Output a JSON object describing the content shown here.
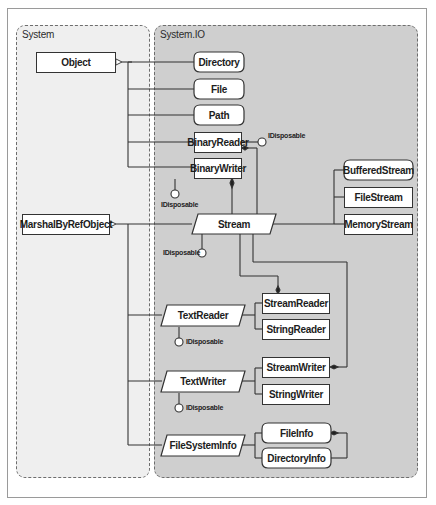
{
  "packages": {
    "system": {
      "label": "System"
    },
    "system_io": {
      "label": "System.IO"
    }
  },
  "classes": {
    "object": "Object",
    "marshal_by_ref_object": "MarshalByRefObject",
    "directory": "Directory",
    "file": "File",
    "path": "Path",
    "binary_reader": "BinaryReader",
    "binary_writer": "BinaryWriter",
    "stream": "Stream",
    "buffered_stream": "BufferedStream",
    "file_stream": "FileStream",
    "memory_stream": "MemoryStream",
    "text_reader": "TextReader",
    "stream_reader": "StreamReader",
    "string_reader": "StringReader",
    "text_writer": "TextWriter",
    "stream_writer": "StreamWriter",
    "string_writer": "StringWriter",
    "file_system_info": "FileSystemInfo",
    "file_info": "FileInfo",
    "directory_info": "DirectoryInfo"
  },
  "interfaces": {
    "binary_reader_idisposable": "IDisposable",
    "binary_writer_idisposable": "IDisposable",
    "stream_idisposable": "IDisposable",
    "text_reader_idisposable": "IDisposable",
    "text_writer_idisposable": "IDisposable"
  },
  "colors": {
    "system_bg": "#efefef",
    "system_io_bg": "#cfcfcf",
    "line": "#333333",
    "box": "#ffffff"
  }
}
